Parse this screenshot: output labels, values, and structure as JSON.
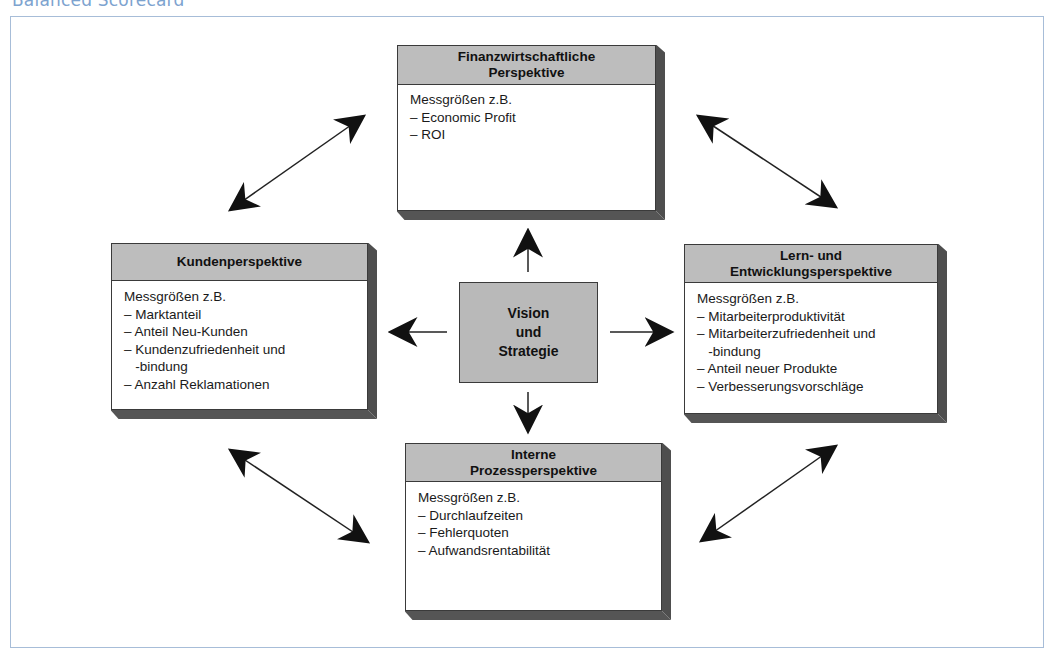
{
  "page_title": "Balanced Scorecard",
  "center": {
    "label": "Vision\nund\nStrategie"
  },
  "perspectives": {
    "finance": {
      "title": "Finanzwirtschaftliche\nPerspektive",
      "intro": "Messgrößen z.B.",
      "items": [
        "– Economic Profit",
        "– ROI"
      ]
    },
    "customer": {
      "title": "Kundenperspektive",
      "intro": "Messgrößen z.B.",
      "items": [
        "– Marktanteil",
        "– Anteil Neu-Kunden",
        "– Kundenzufriedenheit und",
        "   -bindung",
        "– Anzahl Reklamationen"
      ]
    },
    "learning": {
      "title": "Lern- und\nEntwicklungsperspektive",
      "intro": "Messgrößen z.B.",
      "items": [
        "– Mitarbeiterproduktivität",
        "– Mitarbeiterzufriedenheit und",
        "   -bindung",
        "– Anteil neuer Produkte",
        "– Verbesserungsvorschläge"
      ]
    },
    "process": {
      "title": "Interne\nProzessperspektive",
      "intro": "Messgrößen z.B.",
      "items": [
        "– Durchlaufzeiten",
        "– Fehlerquoten",
        "– Aufwandsrentabilität"
      ]
    }
  },
  "colors": {
    "frame_border": "#a7bdd8",
    "title_color": "#7da3cf",
    "header_fill": "#bdbdbd",
    "shadow": "#4e4e4e",
    "arrow": "#111111"
  }
}
